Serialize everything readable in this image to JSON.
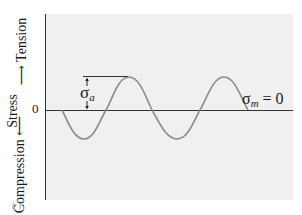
{
  "figure": {
    "type": "alternating-stress-cycle",
    "y_axis": {
      "title": "Stress",
      "positive_label": "Tension",
      "negative_label": "Compression",
      "origin_label": "0"
    },
    "annotations": {
      "amplitude_symbol": "σ",
      "amplitude_subscript": "a",
      "mean_symbol": "σ",
      "mean_subscript": "m",
      "mean_value": " = 0"
    },
    "panel_mark": "(   )",
    "colors": {
      "plot_background": "#f0f0f0",
      "curve": "#8a8a8a",
      "axis": "#333333",
      "text": "#1a1a1a"
    },
    "curve": {
      "shape": "sine",
      "cycles": 2,
      "starts_with": "compression",
      "mean": 0
    }
  }
}
